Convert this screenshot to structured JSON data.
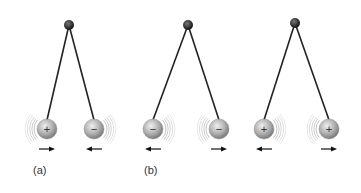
{
  "panels": [
    {
      "label": "(a)",
      "pivot": [
        69,
        25
      ],
      "balls": [
        {
          "x": 47,
          "y": 129,
          "charge": "+",
          "waves": "left",
          "arrow": "right"
        },
        {
          "x": 94,
          "y": 129,
          "charge": "−",
          "waves": "right",
          "arrow": "left"
        }
      ]
    },
    {
      "label": "(b)",
      "pivot": [
        188,
        25
      ],
      "balls": [
        {
          "x": 153,
          "y": 129,
          "charge": "−",
          "waves": "right",
          "arrow": "left"
        },
        {
          "x": 219,
          "y": 129,
          "charge": "−",
          "waves": "left",
          "arrow": "right"
        }
      ]
    },
    {
      "label": "",
      "pivot": [
        295,
        23
      ],
      "balls": [
        {
          "x": 264,
          "y": 129,
          "charge": "+",
          "waves": "right",
          "arrow": "left"
        },
        {
          "x": 329,
          "y": 129,
          "charge": "+",
          "waves": "left",
          "arrow": "right"
        }
      ]
    }
  ],
  "colors": {
    "string": "#222222",
    "pivot": "#2a2a2a",
    "ball_light": "#e4e4e4",
    "ball_dark": "#8a8a8a",
    "wave": "#b5b5b5",
    "arrow": "#111111"
  }
}
